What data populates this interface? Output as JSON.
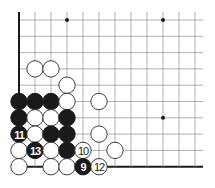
{
  "diagram": {
    "type": "go-board-corner",
    "visible_columns": 12,
    "visible_rows": 10,
    "edges": [
      "left",
      "bottom"
    ],
    "colors": {
      "black_stone": "#1a1a1a",
      "white_stone": "#ffffff",
      "grid": "#9a9a9a",
      "edge": "#1a1a1a"
    },
    "star_points": [
      {
        "col": 3,
        "row": 0
      },
      {
        "col": 9,
        "row": 0
      },
      {
        "col": 9,
        "row": 6
      }
    ],
    "stones": [
      {
        "col": 1,
        "row": 3,
        "color": "white",
        "label": ""
      },
      {
        "col": 2,
        "row": 3,
        "color": "white",
        "label": ""
      },
      {
        "col": 3,
        "row": 4,
        "color": "white",
        "label": ""
      },
      {
        "col": 0,
        "row": 5,
        "color": "black",
        "label": ""
      },
      {
        "col": 1,
        "row": 5,
        "color": "black",
        "label": ""
      },
      {
        "col": 2,
        "row": 5,
        "color": "black",
        "label": ""
      },
      {
        "col": 3,
        "row": 5,
        "color": "white",
        "label": ""
      },
      {
        "col": 5,
        "row": 5,
        "color": "white",
        "label": ""
      },
      {
        "col": 0,
        "row": 6,
        "color": "black",
        "label": ""
      },
      {
        "col": 1,
        "row": 6,
        "color": "white",
        "label": ""
      },
      {
        "col": 2,
        "row": 6,
        "color": "white",
        "label": ""
      },
      {
        "col": 3,
        "row": 6,
        "color": "black",
        "label": ""
      },
      {
        "col": 0,
        "row": 7,
        "color": "black",
        "label": "11"
      },
      {
        "col": 1,
        "row": 7,
        "color": "white",
        "label": ""
      },
      {
        "col": 2,
        "row": 7,
        "color": "black",
        "label": ""
      },
      {
        "col": 3,
        "row": 7,
        "color": "black",
        "label": ""
      },
      {
        "col": 5,
        "row": 7,
        "color": "white",
        "label": ""
      },
      {
        "col": 0,
        "row": 8,
        "color": "white",
        "label": ""
      },
      {
        "col": 1,
        "row": 8,
        "color": "black",
        "label": "13"
      },
      {
        "col": 2,
        "row": 8,
        "color": "white",
        "label": ""
      },
      {
        "col": 3,
        "row": 8,
        "color": "black",
        "label": ""
      },
      {
        "col": 4,
        "row": 8,
        "color": "white",
        "label": "10"
      },
      {
        "col": 6,
        "row": 8,
        "color": "white",
        "label": ""
      },
      {
        "col": 0,
        "row": 9,
        "color": "white",
        "label": ""
      },
      {
        "col": 2,
        "row": 9,
        "color": "white",
        "label": ""
      },
      {
        "col": 3,
        "row": 9,
        "color": "white",
        "label": ""
      },
      {
        "col": 4,
        "row": 9,
        "color": "black",
        "label": "9"
      },
      {
        "col": 5,
        "row": 9,
        "color": "white",
        "label": "12"
      }
    ]
  }
}
